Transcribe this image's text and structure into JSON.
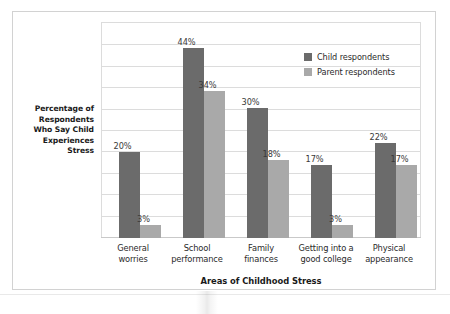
{
  "chart_data": {
    "type": "bar",
    "title": "",
    "xlabel": "Areas of Childhood Stress",
    "ylabel": "Percentage of Respondents Who Say Child Experiences Stress",
    "ylim": [
      0,
      50
    ],
    "grid": true,
    "legend_position": "top-right",
    "categories": [
      "General worries",
      "School performance",
      "Family finances",
      "Getting into a good college",
      "Physical appearance"
    ],
    "category_lines": [
      [
        "General",
        "worries"
      ],
      [
        "School",
        "performance"
      ],
      [
        "Family",
        "finances"
      ],
      [
        "Getting into a",
        "good college"
      ],
      [
        "Physical",
        "appearance"
      ]
    ],
    "series": [
      {
        "name": "Child respondents",
        "color": "#6b6b6b",
        "values": [
          20,
          44,
          30,
          17,
          22
        ],
        "labels": [
          "20%",
          "44%",
          "30%",
          "17%",
          "22%"
        ]
      },
      {
        "name": "Parent respondents",
        "color": "#a9a9a9",
        "values": [
          3,
          34,
          18,
          3,
          17
        ],
        "labels": [
          "3%",
          "34%",
          "18%",
          "3%",
          "17%"
        ]
      }
    ]
  },
  "axis": {
    "y_title_lines": [
      "Percentage of",
      "Respondents",
      "Who Say Child",
      "Experiences",
      "Stress"
    ],
    "x_title": "Areas of Childhood Stress"
  },
  "legend": {
    "items": [
      {
        "label": "Child respondents",
        "color": "#6b6b6b"
      },
      {
        "label": "Parent respondents",
        "color": "#a9a9a9"
      }
    ]
  },
  "bar_labels": {
    "g1c": "20%",
    "g1p": "3%",
    "g2c": "44%",
    "g2p": "34%",
    "g3c": "30%",
    "g3p": "18%",
    "g4c": "17%",
    "g4p": "3%",
    "g5c": "22%",
    "g5p": "17%"
  },
  "category_labels": {
    "c1l1": "General",
    "c1l2": "worries",
    "c2l1": "School",
    "c2l2": "performance",
    "c3l1": "Family",
    "c3l2": "finances",
    "c4l1": "Getting into a",
    "c4l2": "good college",
    "c5l1": "Physical",
    "c5l2": "appearance"
  },
  "colors": {
    "child": "#6b6b6b",
    "parent": "#a9a9a9",
    "grid": "#dcdcdc",
    "frame": "#d2d2d2"
  }
}
